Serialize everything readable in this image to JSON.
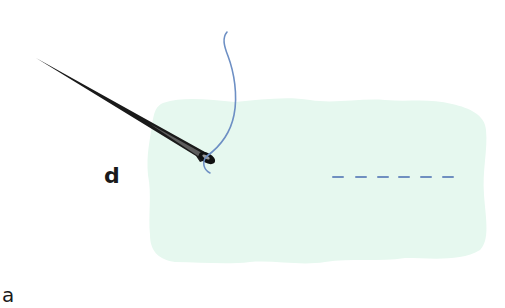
{
  "figure": {
    "labels": {
      "step": "d",
      "panel": "a"
    },
    "colors": {
      "fabric": "#e6f8ef",
      "thread": "#6d8fc4",
      "stitch": "#6f8fc0",
      "needle": "#1a1a1a",
      "text": "#1a1a1a"
    },
    "elements": {
      "needle": "needle-icon",
      "thread": "thread-icon",
      "fabric": "fabric-swatch",
      "stitches": "running-stitch-line"
    },
    "stitch_count": 6
  }
}
